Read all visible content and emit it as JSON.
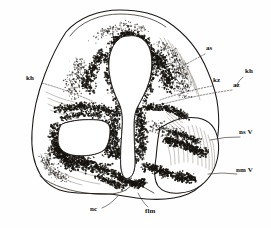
{
  "figure": {
    "medium": "ink-stipple-drawing",
    "background_color": "#fefefe",
    "ink_color": "#1a1715",
    "stipple_color": "#17140f"
  },
  "labels": [
    {
      "id": "as",
      "text": "as",
      "x": 206,
      "y": 48,
      "side": "right",
      "leader_from": [
        205,
        54
      ],
      "leader_to": [
        158,
        82
      ]
    },
    {
      "id": "kz",
      "text": "kz",
      "x": 213,
      "y": 80,
      "side": "right",
      "leader_from": [
        212,
        86
      ],
      "leader_to": [
        160,
        100
      ]
    },
    {
      "id": "az",
      "text": "az",
      "x": 233,
      "y": 84,
      "side": "right",
      "leader_from": [
        232,
        90
      ],
      "leader_to": [
        163,
        104
      ]
    },
    {
      "id": "kh-right",
      "text": "kh",
      "x": 245,
      "y": 71,
      "side": "right",
      "leader_from": [
        243,
        77
      ],
      "leader_to": [
        236,
        86
      ]
    },
    {
      "id": "kh-left",
      "text": "kh",
      "x": 28,
      "y": 78,
      "side": "left",
      "leader_from": [
        42,
        83
      ],
      "leader_to": [
        92,
        101
      ]
    },
    {
      "id": "nsV",
      "text": "ns V",
      "x": 241,
      "y": 132,
      "side": "right",
      "leader_from": [
        240,
        137
      ],
      "leader_to": [
        210,
        140
      ]
    },
    {
      "id": "nmV",
      "text": "nm V",
      "x": 238,
      "y": 170,
      "side": "right",
      "leader_from": [
        237,
        174
      ],
      "leader_to": [
        208,
        174
      ]
    },
    {
      "id": "nc",
      "text": "nc",
      "x": 92,
      "y": 208,
      "side": "bottom",
      "leader_from": [
        102,
        208
      ],
      "leader_to": [
        118,
        196
      ]
    },
    {
      "id": "flm",
      "text": "flm",
      "x": 146,
      "y": 210,
      "side": "bottom",
      "leader_from": [
        148,
        207
      ],
      "leader_to": [
        138,
        193
      ]
    }
  ],
  "structures": [
    {
      "id": "neural-tube-outline",
      "name": "neural tube outer contour"
    },
    {
      "id": "central-canal",
      "name": "central canal / ventricular lumen"
    },
    {
      "id": "left-lateral-cavity",
      "name": "left lateral cavity"
    },
    {
      "id": "right-lobe",
      "name": "right basal lobe"
    },
    {
      "id": "floor-plate",
      "name": "floor plate region"
    },
    {
      "id": "mantle-layer",
      "name": "stippled mantle layer"
    }
  ]
}
